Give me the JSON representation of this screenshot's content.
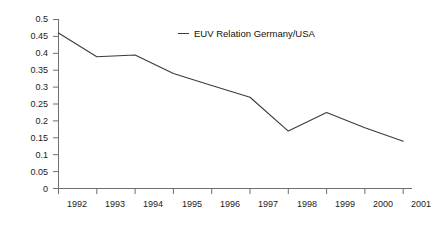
{
  "chart_data": {
    "type": "line",
    "title": "",
    "subtitle": "",
    "xlabel": "",
    "ylabel": "",
    "categories": [
      "1992",
      "1993",
      "1994",
      "1995",
      "1996",
      "1997",
      "1998",
      "1999",
      "2000",
      "2001"
    ],
    "series": [
      {
        "name": "EUV Relation Germany/USA",
        "values": [
          0.46,
          0.39,
          0.395,
          0.34,
          0.305,
          0.27,
          0.17,
          0.225,
          0.18,
          0.14
        ],
        "color": "#3b3b3b"
      }
    ],
    "ylim": [
      0,
      0.5
    ],
    "y_ticks": [
      0,
      0.05,
      0.1,
      0.15,
      0.2,
      0.25,
      0.3,
      0.35,
      0.4,
      0.45,
      0.5
    ],
    "y_tick_labels": [
      "0",
      "0.05",
      "0.1",
      "0.15",
      "0.2",
      "0.25",
      "0.3",
      "0.35",
      "0.4",
      "0.45",
      "0.5"
    ],
    "x_tick_labels": [
      "1992",
      "1993",
      "1994",
      "1995",
      "1996",
      "1997",
      "1998",
      "1999",
      "2000",
      "2001"
    ],
    "grid": false,
    "legend": {
      "position": "inside-top-center",
      "entries": [
        {
          "label": "EUV Relation Germany/USA",
          "marker": "line-dash",
          "color": "#3b3b3b"
        }
      ]
    },
    "axis_color": "#6f6f6f",
    "background": "#ffffff"
  }
}
